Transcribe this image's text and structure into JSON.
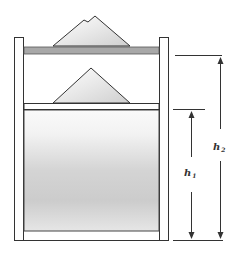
{
  "diagram": {
    "title": "",
    "labels": {
      "h1": {
        "base": "h",
        "sub": "1"
      },
      "h2": {
        "base": "h",
        "sub": "2"
      }
    },
    "elements": [
      "container",
      "upper-piston-plate",
      "upper-sand-pile",
      "lower-piston-plate",
      "lower-sand-pile",
      "fluid-column",
      "height-arrow-h1",
      "height-arrow-h2"
    ],
    "colors": {
      "stroke": "#333333",
      "plate_fill": "#a8a8a8",
      "fluid_light": "#f4f4f4",
      "fluid_dark": "#c8c8c8",
      "pile_light": "#fbfbfb",
      "pile_dark": "#d6d6d6"
    }
  }
}
